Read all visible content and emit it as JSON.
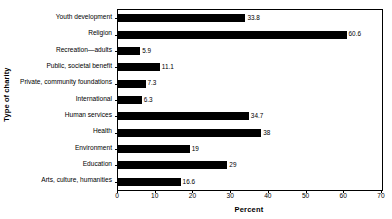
{
  "chart_data": {
    "type": "bar",
    "orientation": "horizontal",
    "title": "",
    "xlabel": "Percent",
    "ylabel": "Type of charity",
    "categories": [
      "Youth development",
      "Religion",
      "Recreation—adults",
      "Public, societal benefit",
      "Private, community foundations",
      "International",
      "Human services",
      "Health",
      "Environment",
      "Education",
      "Arts, culture, humanities"
    ],
    "values": [
      33.8,
      60.6,
      5.9,
      11.1,
      7.3,
      6.3,
      34.7,
      38,
      19,
      29,
      16.6
    ],
    "value_labels": [
      "33.8",
      "60.6",
      "5.9",
      "11.1",
      "7.3",
      "6.3",
      "34.7",
      "38",
      "19",
      "29",
      "16.6"
    ],
    "xlim": [
      0,
      70
    ],
    "xticks": [
      0,
      10,
      20,
      30,
      40,
      50,
      60,
      70
    ],
    "xtick_labels": [
      "0",
      "10",
      "20",
      "30",
      "40",
      "50",
      "60",
      "70"
    ],
    "grid": false,
    "legend": null,
    "bar_color": "#000000",
    "background_color": "#ffffff",
    "frame_color": "#000000"
  }
}
